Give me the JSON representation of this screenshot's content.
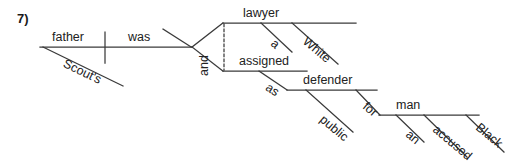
{
  "page": {
    "exercise_number": "7)",
    "width": 528,
    "height": 168,
    "background_color": "#ffffff",
    "line_color": "#3a3a3a",
    "text_color": "#222222"
  },
  "diagram": {
    "type": "reed-kellogg-sentence-diagram",
    "sentence": "Scout's father was a White lawyer and assigned as public defender for an accused Black man",
    "subject": {
      "label": "father",
      "modifier": {
        "label": "Scout's",
        "type": "possessive"
      }
    },
    "verb": {
      "label": "was",
      "type": "linking"
    },
    "conjunction": {
      "label": "and",
      "orientation": "vertical",
      "line_style": "dotted"
    },
    "branches": [
      {
        "name": "upper-branch",
        "head": {
          "label": "lawyer",
          "role": "predicate-nominative"
        },
        "modifiers": [
          {
            "label": "a",
            "type": "article"
          },
          {
            "label": "White",
            "type": "adjective"
          }
        ]
      },
      {
        "name": "lower-branch",
        "head": {
          "label": "assigned",
          "role": "predicate-adjective"
        },
        "modifiers": [
          {
            "label": "as",
            "type": "preposition",
            "object": {
              "label": "defender",
              "modifiers": [
                {
                  "label": "public",
                  "type": "adjective"
                },
                {
                  "label": "for",
                  "type": "preposition",
                  "object": {
                    "label": "man",
                    "modifiers": [
                      {
                        "label": "an",
                        "type": "article"
                      },
                      {
                        "label": "accused",
                        "type": "adjective"
                      },
                      {
                        "label": "Black",
                        "type": "adjective"
                      }
                    ]
                  }
                }
              ]
            }
          }
        ]
      }
    ],
    "words": {
      "father": "father",
      "scouts": "Scout's",
      "was": "was",
      "and": "and",
      "lawyer": "lawyer",
      "a": "a",
      "white": "White",
      "assigned": "assigned",
      "as": "as",
      "defender": "defender",
      "public": "public",
      "for": "for",
      "man": "man",
      "an": "an",
      "accused": "accused",
      "black": "Black"
    }
  }
}
